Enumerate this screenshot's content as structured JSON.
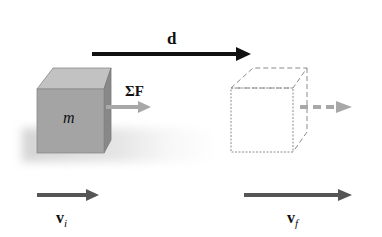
{
  "diagram": {
    "colors": {
      "background": "#ffffff",
      "block_front": "#a4a4a4",
      "block_top": "#c2c2c2",
      "block_side": "#8a8a8a",
      "shadow": "#d8d8d8",
      "displacement_arrow": "#111111",
      "velocity_arrow": "#555555",
      "force_arrow": "#a8a8a8",
      "dashed_outline": "#8c8c8c"
    },
    "labels": {
      "displacement": "d",
      "force": "ΣF",
      "mass": "m",
      "v_initial_main": "v",
      "v_initial_sub": "i",
      "v_final_main": "v",
      "v_final_sub": "f"
    },
    "elements": [
      {
        "id": "block-initial",
        "type": "solid-cube",
        "label": "m"
      },
      {
        "id": "block-final",
        "type": "dashed-cube"
      },
      {
        "id": "displacement-arrow",
        "label": "d",
        "direction": "right"
      },
      {
        "id": "net-force-arrow",
        "label": "ΣF",
        "direction": "right"
      },
      {
        "id": "final-force-arrow",
        "style": "dashed",
        "direction": "right"
      },
      {
        "id": "initial-velocity-arrow",
        "label": "v_i",
        "direction": "right",
        "length": "short"
      },
      {
        "id": "final-velocity-arrow",
        "label": "v_f",
        "direction": "right",
        "length": "long"
      }
    ]
  }
}
